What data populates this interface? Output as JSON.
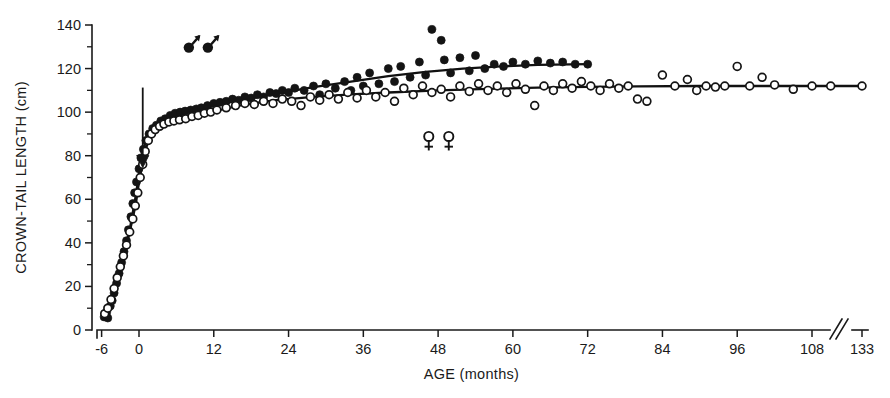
{
  "figure": {
    "background_color": "#ffffff",
    "ink_color": "#141414"
  },
  "chart_data": {
    "type": "scatter",
    "title": "",
    "subtitle": "",
    "xlabel": "AGE (months)",
    "ylabel": "CROWN-TAIL LENGTH (cm)",
    "xlim": [
      -6,
      133
    ],
    "ylim": [
      0,
      140
    ],
    "grid": false,
    "legend_position": "none",
    "x_ticks": [
      -6,
      0,
      12,
      24,
      36,
      48,
      60,
      72,
      84,
      96,
      108,
      133
    ],
    "x_tick_labels": [
      "-6",
      "0",
      "12",
      "24",
      "36",
      "48",
      "60",
      "72",
      "84",
      "96",
      "108",
      "133"
    ],
    "x_axis_break_between": [
      108,
      133
    ],
    "y_ticks": [
      0,
      20,
      40,
      60,
      80,
      100,
      120,
      140
    ],
    "y_tick_labels": [
      "0",
      "20",
      "40",
      "60",
      "80",
      "100",
      "120",
      "140"
    ],
    "y_minor_ticks": [
      10,
      30,
      50,
      70,
      90,
      110,
      130
    ],
    "annotations": [
      {
        "name": "male-symbol-pair",
        "glyph": "male",
        "count": 2,
        "x": 8.0,
        "y": 131.0
      },
      {
        "name": "female-symbol-pair",
        "glyph": "female",
        "count": 2,
        "x": 46.5,
        "y": 87.0
      },
      {
        "name": "birth-arrow",
        "glyph": "down-arrow",
        "x": 0.6,
        "y_from": 92.0,
        "y_to": 76.0
      }
    ],
    "series": [
      {
        "name": "Males",
        "marker": "filled-circle",
        "symbol": "male",
        "color": "#141414",
        "points": [
          [
            -5.6,
            6.0
          ],
          [
            -5.2,
            8.0
          ],
          [
            -5.0,
            5.5
          ],
          [
            -4.6,
            11.0
          ],
          [
            -4.3,
            13.5
          ],
          [
            -4.0,
            17.0
          ],
          [
            -3.6,
            21.5
          ],
          [
            -3.2,
            26.0
          ],
          [
            -2.8,
            31.0
          ],
          [
            -2.4,
            36.0
          ],
          [
            -2.0,
            41.0
          ],
          [
            -1.7,
            46.0
          ],
          [
            -1.3,
            52.0
          ],
          [
            -1.0,
            58.0
          ],
          [
            -0.7,
            63.0
          ],
          [
            -0.4,
            68.0
          ],
          [
            0.0,
            74.0
          ],
          [
            0.3,
            79.0
          ],
          [
            0.7,
            83.0
          ],
          [
            1.1,
            87.0
          ],
          [
            1.6,
            90.0
          ],
          [
            2.2,
            92.5
          ],
          [
            2.8,
            94.0
          ],
          [
            3.5,
            96.0
          ],
          [
            4.2,
            97.0
          ],
          [
            5.0,
            98.5
          ],
          [
            5.8,
            99.5
          ],
          [
            6.6,
            100.0
          ],
          [
            7.4,
            100.5
          ],
          [
            8.3,
            101.0
          ],
          [
            9.2,
            101.5
          ],
          [
            10.0,
            102.0
          ],
          [
            11.0,
            103.0
          ],
          [
            12.0,
            104.0
          ],
          [
            13.0,
            104.5
          ],
          [
            14.0,
            105.0
          ],
          [
            15.0,
            106.0
          ],
          [
            16.0,
            105.5
          ],
          [
            17.0,
            107.0
          ],
          [
            18.0,
            106.5
          ],
          [
            19.0,
            108.0
          ],
          [
            20.0,
            107.0
          ],
          [
            21.0,
            109.0
          ],
          [
            22.0,
            108.5
          ],
          [
            23.0,
            110.0
          ],
          [
            24.0,
            109.0
          ],
          [
            25.0,
            111.0
          ],
          [
            26.5,
            110.0
          ],
          [
            28.0,
            112.0
          ],
          [
            29.0,
            108.0
          ],
          [
            30.0,
            113.0
          ],
          [
            31.5,
            111.0
          ],
          [
            33.0,
            114.0
          ],
          [
            34.0,
            110.0
          ],
          [
            35.0,
            116.0
          ],
          [
            36.0,
            112.0
          ],
          [
            37.0,
            118.0
          ],
          [
            38.5,
            113.0
          ],
          [
            40.0,
            120.0
          ],
          [
            41.0,
            114.0
          ],
          [
            42.0,
            121.0
          ],
          [
            43.5,
            116.0
          ],
          [
            45.0,
            123.0
          ],
          [
            46.0,
            117.0
          ],
          [
            47.0,
            138.0
          ],
          [
            48.5,
            133.0
          ],
          [
            49.0,
            124.0
          ],
          [
            50.0,
            118.0
          ],
          [
            51.5,
            125.0
          ],
          [
            53.0,
            119.0
          ],
          [
            54.0,
            126.0
          ],
          [
            55.5,
            120.0
          ],
          [
            57.0,
            122.0
          ],
          [
            58.5,
            121.0
          ],
          [
            60.0,
            123.0
          ],
          [
            62.0,
            122.0
          ],
          [
            64.0,
            123.5
          ],
          [
            66.0,
            122.5
          ],
          [
            68.0,
            123.0
          ],
          [
            70.0,
            122.0
          ],
          [
            72.0,
            122.0
          ]
        ]
      },
      {
        "name": "Females",
        "marker": "open-circle",
        "symbol": "female",
        "color": "#ffffff",
        "points": [
          [
            -5.5,
            7.5
          ],
          [
            -5.0,
            10.0
          ],
          [
            -4.5,
            14.0
          ],
          [
            -4.0,
            19.0
          ],
          [
            -3.5,
            24.0
          ],
          [
            -3.0,
            29.0
          ],
          [
            -2.5,
            34.0
          ],
          [
            -2.0,
            39.0
          ],
          [
            -1.5,
            45.0
          ],
          [
            -1.0,
            51.0
          ],
          [
            -0.6,
            57.0
          ],
          [
            -0.2,
            63.0
          ],
          [
            0.2,
            70.0
          ],
          [
            0.6,
            76.0
          ],
          [
            1.0,
            82.0
          ],
          [
            1.5,
            87.0
          ],
          [
            2.0,
            90.0
          ],
          [
            2.6,
            92.0
          ],
          [
            3.3,
            93.5
          ],
          [
            4.0,
            94.5
          ],
          [
            4.8,
            95.5
          ],
          [
            5.6,
            96.0
          ],
          [
            6.5,
            96.5
          ],
          [
            7.5,
            97.0
          ],
          [
            8.5,
            98.0
          ],
          [
            9.5,
            98.5
          ],
          [
            10.5,
            99.5
          ],
          [
            11.5,
            100.0
          ],
          [
            12.5,
            101.0
          ],
          [
            14.0,
            102.0
          ],
          [
            15.5,
            103.0
          ],
          [
            17.0,
            104.0
          ],
          [
            18.5,
            103.5
          ],
          [
            20.0,
            105.0
          ],
          [
            21.5,
            104.0
          ],
          [
            23.0,
            106.0
          ],
          [
            24.5,
            105.0
          ],
          [
            26.0,
            103.0
          ],
          [
            27.5,
            107.0
          ],
          [
            29.0,
            105.5
          ],
          [
            30.5,
            108.0
          ],
          [
            32.0,
            106.0
          ],
          [
            33.5,
            109.0
          ],
          [
            35.0,
            106.5
          ],
          [
            36.5,
            110.0
          ],
          [
            38.0,
            107.0
          ],
          [
            39.5,
            109.0
          ],
          [
            41.0,
            105.0
          ],
          [
            42.5,
            111.0
          ],
          [
            44.0,
            108.0
          ],
          [
            45.5,
            112.0
          ],
          [
            47.0,
            109.0
          ],
          [
            48.5,
            110.5
          ],
          [
            50.0,
            107.0
          ],
          [
            51.5,
            112.0
          ],
          [
            53.0,
            109.5
          ],
          [
            54.5,
            113.0
          ],
          [
            56.0,
            110.0
          ],
          [
            57.5,
            112.0
          ],
          [
            59.0,
            109.0
          ],
          [
            60.5,
            113.0
          ],
          [
            62.0,
            110.5
          ],
          [
            63.5,
            103.0
          ],
          [
            65.0,
            112.0
          ],
          [
            66.5,
            110.0
          ],
          [
            68.0,
            113.0
          ],
          [
            69.5,
            111.0
          ],
          [
            71.0,
            114.0
          ],
          [
            72.5,
            112.0
          ],
          [
            74.0,
            110.0
          ],
          [
            75.5,
            113.0
          ],
          [
            77.0,
            111.0
          ],
          [
            78.5,
            112.0
          ],
          [
            80.0,
            106.0
          ],
          [
            81.5,
            105.0
          ],
          [
            84.0,
            117.0
          ],
          [
            86.0,
            112.0
          ],
          [
            88.0,
            115.0
          ],
          [
            89.5,
            110.0
          ],
          [
            91.0,
            112.0
          ],
          [
            92.5,
            111.5
          ],
          [
            94.0,
            112.0
          ],
          [
            96.0,
            121.0
          ],
          [
            98.0,
            112.0
          ],
          [
            100.0,
            116.0
          ],
          [
            102.0,
            112.5
          ],
          [
            105.0,
            110.5
          ],
          [
            108.0,
            112.0
          ],
          [
            111.0,
            112.0
          ],
          [
            133.0,
            112.0
          ]
        ]
      }
    ],
    "fit_curves": [
      {
        "name": "male-growth-curve",
        "for_series": "Males",
        "points": [
          [
            -5.6,
            6.5
          ],
          [
            -4.5,
            14.0
          ],
          [
            -3.5,
            24.0
          ],
          [
            -2.5,
            34.5
          ],
          [
            -1.5,
            46.0
          ],
          [
            -0.5,
            62.0
          ],
          [
            0.0,
            72.0
          ],
          [
            0.5,
            81.0
          ],
          [
            1.2,
            87.5
          ],
          [
            2.0,
            91.0
          ],
          [
            3.0,
            93.5
          ],
          [
            4.5,
            96.0
          ],
          [
            6.0,
            98.0
          ],
          [
            8.0,
            100.0
          ],
          [
            10.0,
            101.5
          ],
          [
            13.0,
            103.5
          ],
          [
            17.0,
            106.0
          ],
          [
            22.0,
            108.5
          ],
          [
            28.0,
            111.5
          ],
          [
            34.0,
            114.0
          ],
          [
            40.0,
            116.5
          ],
          [
            46.0,
            118.5
          ],
          [
            52.0,
            120.0
          ],
          [
            58.0,
            121.0
          ],
          [
            64.0,
            121.7
          ],
          [
            72.0,
            122.0
          ]
        ]
      },
      {
        "name": "female-growth-curve",
        "for_series": "Females",
        "points": [
          [
            -5.5,
            7.5
          ],
          [
            -4.5,
            14.5
          ],
          [
            -3.5,
            24.0
          ],
          [
            -2.5,
            34.0
          ],
          [
            -1.5,
            45.0
          ],
          [
            -0.5,
            58.0
          ],
          [
            0.0,
            68.0
          ],
          [
            0.6,
            77.0
          ],
          [
            1.3,
            85.0
          ],
          [
            2.2,
            90.0
          ],
          [
            3.2,
            92.5
          ],
          [
            4.5,
            94.5
          ],
          [
            6.0,
            96.0
          ],
          [
            8.0,
            97.5
          ],
          [
            10.0,
            99.0
          ],
          [
            13.0,
            101.0
          ],
          [
            17.0,
            103.5
          ],
          [
            22.0,
            105.5
          ],
          [
            28.0,
            107.0
          ],
          [
            34.0,
            108.2
          ],
          [
            40.0,
            109.0
          ],
          [
            48.0,
            110.0
          ],
          [
            56.0,
            110.7
          ],
          [
            64.0,
            111.2
          ],
          [
            72.0,
            111.6
          ],
          [
            80.0,
            111.8
          ],
          [
            90.0,
            112.0
          ],
          [
            100.0,
            112.0
          ],
          [
            111.0,
            112.0
          ],
          [
            133.0,
            112.0
          ]
        ]
      }
    ]
  }
}
